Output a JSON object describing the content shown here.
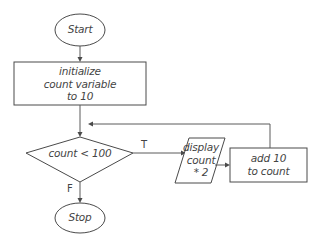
{
  "diagram": {
    "type": "flowchart",
    "nodes": {
      "start": {
        "label": "Start",
        "shape": "terminator"
      },
      "init": {
        "lines": [
          "initialize",
          "count variable",
          "to 10"
        ],
        "shape": "process"
      },
      "decision": {
        "label": "count < 100",
        "shape": "decision"
      },
      "display": {
        "lines": [
          "display",
          "count",
          "* 2"
        ],
        "shape": "input-output"
      },
      "add": {
        "lines": [
          "add 10",
          "to count"
        ],
        "shape": "process"
      },
      "stop": {
        "label": "Stop",
        "shape": "terminator"
      }
    },
    "edges": [
      {
        "from": "start",
        "to": "init",
        "label": ""
      },
      {
        "from": "init",
        "to": "decision",
        "label": ""
      },
      {
        "from": "decision",
        "to": "display",
        "label": "T"
      },
      {
        "from": "display",
        "to": "add",
        "label": ""
      },
      {
        "from": "add",
        "to": "decision",
        "label": ""
      },
      {
        "from": "decision",
        "to": "stop",
        "label": "F"
      }
    ],
    "branch_labels": {
      "true": "T",
      "false": "F"
    },
    "colors": {
      "stroke": "#4a4a4a",
      "text": "#444444",
      "background": "#ffffff"
    }
  }
}
